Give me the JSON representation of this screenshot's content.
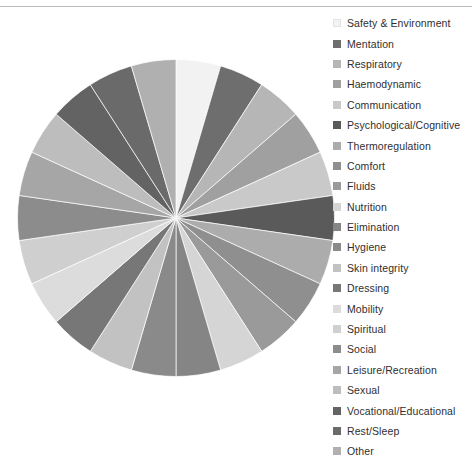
{
  "chart_data": {
    "type": "pie",
    "title": "",
    "subtitle": "",
    "xlabel": "",
    "ylabel": "",
    "legend_position": "right",
    "grid": false,
    "start_angle_deg": 0,
    "direction": "clockwise",
    "total": 21,
    "categories": [
      "Safety & Environment",
      "Mentation",
      "Respiratory",
      "Haemodynamic",
      "Communication",
      "Psychological/Cognitive",
      "Thermoregulation",
      "Comfort",
      "Fluids",
      "Nutrition",
      "Elimination",
      "Hygiene",
      "Skin integrity",
      "Dressing",
      "Mobility",
      "Spiritual",
      "Social",
      "Leisure/Recreation",
      "Sexual",
      "Vocational/Educational",
      "Rest/Sleep",
      "Other"
    ],
    "values": [
      1,
      1,
      1,
      1,
      1,
      1,
      1,
      1,
      1,
      1,
      1,
      1,
      1,
      1,
      1,
      1,
      1,
      1,
      1,
      1,
      1,
      1
    ],
    "percentages": [
      4.55,
      4.55,
      4.55,
      4.55,
      4.55,
      4.55,
      4.55,
      4.55,
      4.55,
      4.55,
      4.55,
      4.55,
      4.55,
      4.55,
      4.55,
      4.55,
      4.55,
      4.55,
      4.55,
      4.55,
      4.55,
      4.55
    ],
    "colors": [
      "#f2f2f2",
      "#6e6e6e",
      "#b6b6b6",
      "#a0a0a0",
      "#c9c9c9",
      "#5a5a5a",
      "#acacac",
      "#8f8f8f",
      "#9a9a9a",
      "#d5d5d5",
      "#858585",
      "#8a8a8a",
      "#c2c2c2",
      "#777777",
      "#dcdcdc",
      "#cfcfcf",
      "#8c8c8c",
      "#a6a6a6",
      "#bdbdbd",
      "#636363",
      "#6a6a6a",
      "#b0b0b0"
    ]
  },
  "legend": {
    "items": [
      {
        "label": "Safety & Environment",
        "color": "#f2f2f2"
      },
      {
        "label": "Mentation",
        "color": "#6e6e6e"
      },
      {
        "label": "Respiratory",
        "color": "#b6b6b6"
      },
      {
        "label": "Haemodynamic",
        "color": "#a0a0a0"
      },
      {
        "label": "Communication",
        "color": "#c9c9c9"
      },
      {
        "label": "Psychological/Cognitive",
        "color": "#5a5a5a"
      },
      {
        "label": "Thermoregulation",
        "color": "#acacac"
      },
      {
        "label": "Comfort",
        "color": "#8f8f8f"
      },
      {
        "label": "Fluids",
        "color": "#9a9a9a"
      },
      {
        "label": "Nutrition",
        "color": "#d5d5d5"
      },
      {
        "label": "Elimination",
        "color": "#858585"
      },
      {
        "label": "Hygiene",
        "color": "#8a8a8a"
      },
      {
        "label": "Skin integrity",
        "color": "#c2c2c2"
      },
      {
        "label": "Dressing",
        "color": "#777777"
      },
      {
        "label": "Mobility",
        "color": "#dcdcdc"
      },
      {
        "label": "Spiritual",
        "color": "#cfcfcf"
      },
      {
        "label": "Social",
        "color": "#8c8c8c"
      },
      {
        "label": "Leisure/Recreation",
        "color": "#a6a6a6"
      },
      {
        "label": "Sexual",
        "color": "#bdbdbd"
      },
      {
        "label": "Vocational/Educational",
        "color": "#636363"
      },
      {
        "label": "Rest/Sleep",
        "color": "#6a6a6a"
      },
      {
        "label": "Other",
        "color": "#b0b0b0"
      }
    ]
  },
  "style": {
    "rule_color": "#b9bcbf",
    "background": "#ffffff",
    "text_color": "#2f2f2f"
  }
}
